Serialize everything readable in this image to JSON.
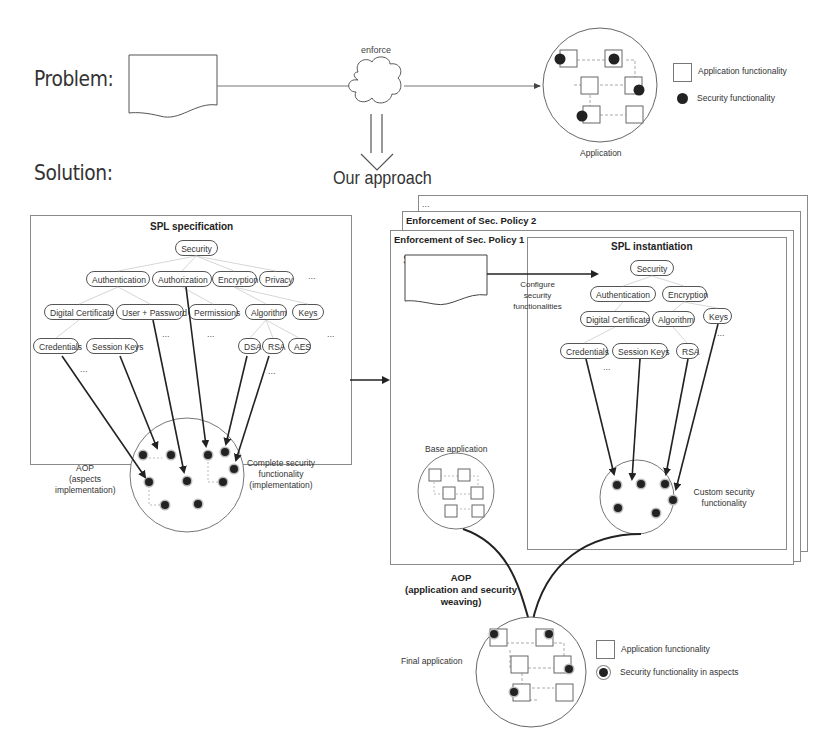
{
  "problem": {
    "label": "Problem:",
    "doc_label": "Security policies",
    "gap_label": "GAP",
    "enforce_label": "enforce",
    "application_label": "Application",
    "legend": [
      {
        "icon": "square-icon",
        "label": "Application functionality"
      },
      {
        "icon": "filled-circle-icon",
        "label": "Security functionality"
      }
    ]
  },
  "solution": {
    "label": "Solution:",
    "approach_label": "Our approach"
  },
  "spl_specification": {
    "title": "SPL specification",
    "root": "Security",
    "level1": [
      "Authentication",
      "Authorization",
      "Encryption",
      "Privacy"
    ],
    "level2": [
      "Digital Certificate",
      "User + Password",
      "Permissions",
      "Algorithm",
      "Keys"
    ],
    "level3": [
      "Credentials",
      "Session Keys",
      "DSA",
      "RSA",
      "AES"
    ],
    "ellipsis": "...",
    "aop_label": [
      "AOP",
      "(aspects",
      "implementation)"
    ],
    "complete_label": [
      "Complete security",
      "functionality",
      "(implementation)"
    ]
  },
  "enforcement": {
    "stack_more": "...",
    "policy2_title": "Enforcement of Sec. Policy 2",
    "policy1_title": "Enforcement of Sec. Policy 1",
    "policy_doc": [
      "Security policy",
      "specification"
    ],
    "configure_label": [
      "Configure",
      "security",
      "functionalities"
    ],
    "base_app_label": "Base application",
    "spl_instantiation": {
      "title": "SPL instantiation",
      "root": "Security",
      "level1": [
        "Authentication",
        "Encryption"
      ],
      "level2": [
        "Digital Certificate",
        "Algorithm",
        "Keys"
      ],
      "level3": [
        "Credentials",
        "Session Keys",
        "RSA"
      ],
      "ellipsis": "...",
      "custom_label": [
        "Custom security",
        "functionality"
      ]
    }
  },
  "weaving": {
    "aop_label": [
      "AOP",
      "(application and security",
      "weaving)"
    ],
    "final_app_label": "Final application",
    "legend": [
      {
        "icon": "square-icon",
        "label": "Application functionality"
      },
      {
        "icon": "ringed-circle-icon",
        "label": "Security functionality in aspects"
      }
    ]
  }
}
